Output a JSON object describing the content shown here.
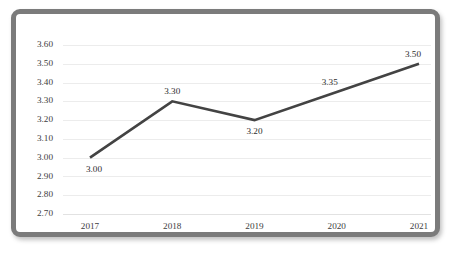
{
  "chart_data": {
    "type": "line",
    "title": "",
    "subtitle": "",
    "xlabel": "",
    "ylabel": "",
    "categories": [
      "2017",
      "2018",
      "2019",
      "2020",
      "2021"
    ],
    "values": [
      3.0,
      3.3,
      3.2,
      3.35,
      3.5
    ],
    "point_labels": [
      "3.00",
      "3.30",
      "3.20",
      "3.35",
      "3.50"
    ],
    "label_positions": [
      "below",
      "above",
      "below",
      "above",
      "above"
    ],
    "ylim": [
      2.7,
      3.6
    ],
    "ytick_step": 0.1,
    "ytick_labels": [
      "3.60",
      "3.50",
      "3.40",
      "3.30",
      "3.20",
      "3.10",
      "3.00",
      "2.90",
      "2.80",
      "2.70"
    ],
    "ytick_values": [
      3.6,
      3.5,
      3.4,
      3.3,
      3.2,
      3.1,
      3.0,
      2.9,
      2.8,
      2.7
    ],
    "grid": "horizontal",
    "legend": "none",
    "series": [
      {
        "name": "",
        "values": [
          3.0,
          3.3,
          3.2,
          3.35,
          3.5
        ]
      }
    ],
    "colors": {
      "line": "#434343",
      "gridline": "#ececec",
      "background": "#ffffff",
      "border": "#7b7b7b",
      "text": "#3d3d3d"
    }
  }
}
